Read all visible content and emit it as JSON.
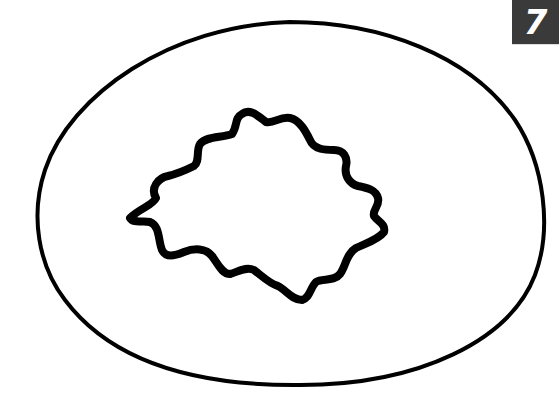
{
  "figure": {
    "badge_number": "7",
    "badge_color": "#3a3a3a",
    "badge_text_color": "#ffffff",
    "stroke_color": "#000000",
    "background": "#ffffff",
    "shapes": [
      {
        "name": "outer-ellipse",
        "type": "ellipse",
        "stroke_width": 4
      },
      {
        "name": "inner-irregular-wavy-shape",
        "type": "wavy-closed-outline",
        "stroke_width": 8
      }
    ]
  }
}
